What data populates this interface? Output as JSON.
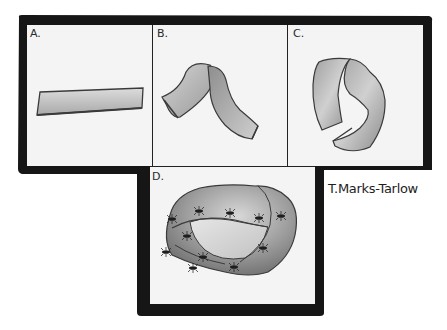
{
  "figure": {
    "colors": {
      "frame": "#161616",
      "panel_bg": "#f4f4f4",
      "strip_light": "#d8d8d8",
      "strip_dark": "#8a8a8a",
      "outline": "#3a3a3a"
    },
    "panels": [
      {
        "id": "A",
        "label": "A.",
        "content": "flat strip of paper"
      },
      {
        "id": "B",
        "label": "B.",
        "content": "strip bent into an arch"
      },
      {
        "id": "C",
        "label": "C.",
        "content": "strip curled with a half twist"
      },
      {
        "id": "D",
        "label": "D.",
        "content": "Mobius strip with ants walking on its surface"
      }
    ],
    "signature": "T.Marks-Tarlow"
  }
}
